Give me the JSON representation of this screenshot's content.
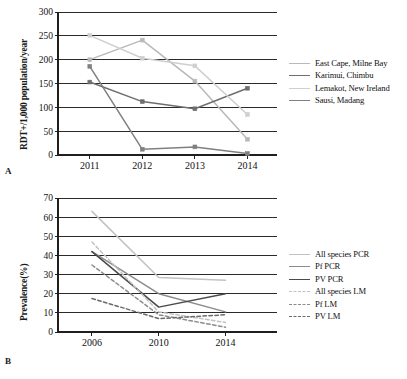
{
  "figure": {
    "panels": [
      {
        "letter": "A",
        "ylabel": "RDT+/1,000 population/year",
        "xlabel": "",
        "legend": [
          {
            "label": "East Cape, Milne Bay",
            "color": "#b9b9b9",
            "style": "solid"
          },
          {
            "label": "Karimui, Chimbu",
            "color": "#6f6f6f",
            "style": "solid"
          },
          {
            "label": "Lemakot, New Ireland",
            "color": "#cfcfcf",
            "style": "solid"
          },
          {
            "label": "Sausi, Madang",
            "color": "#808080",
            "style": "solid"
          }
        ]
      },
      {
        "letter": "B",
        "ylabel": "Prevalence(%)",
        "xlabel": "",
        "legend": [
          {
            "label": "All species PCR",
            "color": "#c2c2c2",
            "style": "solid"
          },
          {
            "label": "Pf PCR",
            "color": "#8c8c8c",
            "style": "solid"
          },
          {
            "label": "PV PCR",
            "color": "#4a4a4a",
            "style": "solid"
          },
          {
            "label": "All species LM",
            "color": "#c2c2c2",
            "style": "dashed"
          },
          {
            "label": "Pf LM",
            "color": "#8c8c8c",
            "style": "dashed"
          },
          {
            "label": "PV LM",
            "color": "#6b6b6b",
            "style": "dashed"
          }
        ]
      }
    ]
  },
  "chart_data": [
    {
      "type": "line",
      "panel": "A",
      "title": "",
      "xlabel": "",
      "ylabel": "RDT+/1,000 population/year",
      "categories": [
        "2011",
        "2012",
        "2013",
        "2014"
      ],
      "x": [
        2011,
        2012,
        2013,
        2014
      ],
      "ylim": [
        0,
        300
      ],
      "yticks": [
        0,
        50,
        100,
        150,
        200,
        250,
        300
      ],
      "grid": true,
      "markers": true,
      "legend_position": "right",
      "series": [
        {
          "name": "East Cape, Milne Bay",
          "color": "#b9b9b9",
          "style": "solid",
          "values": [
            200,
            241,
            155,
            33
          ]
        },
        {
          "name": "Karimui, Chimbu",
          "color": "#6f6f6f",
          "style": "solid",
          "values": [
            153,
            112,
            97,
            140
          ]
        },
        {
          "name": "Lemakot, New Ireland",
          "color": "#cfcfcf",
          "style": "solid",
          "values": [
            251,
            203,
            187,
            85
          ]
        },
        {
          "name": "Sausi, Madang",
          "color": "#808080",
          "style": "solid",
          "values": [
            186,
            12,
            17,
            3
          ]
        }
      ]
    },
    {
      "type": "line",
      "panel": "B",
      "title": "",
      "xlabel": "",
      "ylabel": "Prevalence(%)",
      "categories": [
        "2006",
        "2010",
        "2014"
      ],
      "x": [
        2006,
        2010,
        2014
      ],
      "ylim": [
        0,
        70
      ],
      "yticks": [
        0,
        10,
        20,
        30,
        40,
        50,
        60,
        70
      ],
      "grid": true,
      "markers": false,
      "legend_position": "right",
      "series": [
        {
          "name": "All species PCR",
          "color": "#c2c2c2",
          "style": "solid",
          "values": [
            63,
            28.5,
            27
          ]
        },
        {
          "name": "Pf PCR",
          "color": "#8c8c8c",
          "style": "solid",
          "values": [
            42,
            20,
            10.5
          ]
        },
        {
          "name": "PV PCR",
          "color": "#4a4a4a",
          "style": "solid",
          "values": [
            42,
            13,
            20
          ]
        },
        {
          "name": "All species LM",
          "color": "#c2c2c2",
          "style": "dashed",
          "values": [
            47,
            10.5,
            5
          ]
        },
        {
          "name": "Pf LM",
          "color": "#8c8c8c",
          "style": "dashed",
          "values": [
            35,
            9,
            2.5
          ]
        },
        {
          "name": "PV LM",
          "color": "#6b6b6b",
          "style": "dashed",
          "values": [
            17.5,
            7,
            9
          ]
        }
      ]
    }
  ]
}
